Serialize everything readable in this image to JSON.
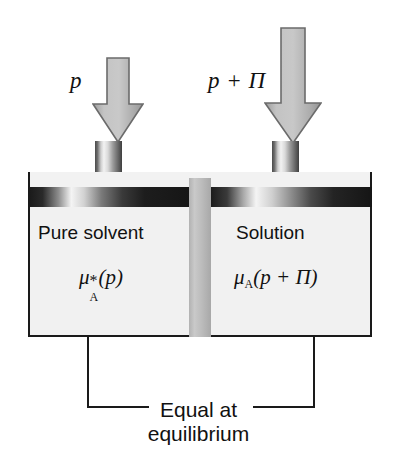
{
  "figure": {
    "colors": {
      "ink": "#111111",
      "liquid": "#f1f1f1",
      "membrane": "#bdbdbd",
      "piston_dark": "#1b1b1b",
      "arrow_fill": "#b4b4b4",
      "arrow_stroke": "#6e6e6e"
    }
  },
  "arrows": {
    "left": {
      "name": "pressure-arrow-left",
      "label": "p",
      "direction": "down"
    },
    "right": {
      "name": "pressure-arrow-right",
      "label": "p + Π",
      "direction": "down"
    }
  },
  "compartments": {
    "left": {
      "label": "Pure solvent",
      "chemical_potential": {
        "symbol": "μ",
        "superscript": "*",
        "subscript": "A",
        "argument": "(p)",
        "full": "μ*A(p)"
      }
    },
    "right": {
      "label": "Solution",
      "chemical_potential": {
        "symbol": "μ",
        "superscript": "",
        "subscript": "A",
        "argument": "(p + Π)",
        "full": "μA(p + Π)"
      }
    }
  },
  "membrane": {
    "name": "semipermeable-membrane"
  },
  "caption": {
    "line1": "Equal at",
    "line2": "equilibrium"
  }
}
